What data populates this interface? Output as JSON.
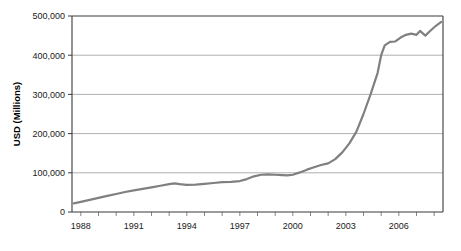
{
  "chart_data": {
    "type": "line",
    "title": "",
    "xlabel": "",
    "ylabel": "USD (Millions)",
    "xlim": [
      1987.5,
      2008.5
    ],
    "ylim": [
      0,
      500000
    ],
    "grid": true,
    "legend": "none",
    "y_ticks": [
      0,
      100000,
      200000,
      300000,
      400000,
      500000
    ],
    "y_tick_labels": [
      "0",
      "100,000",
      "200,000",
      "300,000",
      "400,000",
      "500,000"
    ],
    "x_ticks": [
      1988,
      1991,
      1994,
      1997,
      2000,
      2003,
      2006
    ],
    "x_tick_labels": [
      "1988",
      "1991",
      "1994",
      "1997",
      "2000",
      "2003",
      "2006"
    ],
    "series": [
      {
        "name": "USD (Millions)",
        "color": "#808080",
        "x": [
          1987.6,
          1988,
          1988.5,
          1989,
          1989.5,
          1990,
          1990.5,
          1991,
          1991.5,
          1992,
          1992.5,
          1993,
          1993.3,
          1993.6,
          1994,
          1994.5,
          1995,
          1995.5,
          1996,
          1996.5,
          1997,
          1997.4,
          1997.8,
          1998.2,
          1998.6,
          1999,
          1999.4,
          1999.7,
          2000,
          2000.4,
          2000.8,
          2001.2,
          2001.6,
          2002,
          2002.4,
          2002.8,
          2003.2,
          2003.6,
          2004,
          2004.4,
          2004.8,
          2005,
          2005.2,
          2005.5,
          2005.8,
          2006.1,
          2006.4,
          2006.7,
          2007,
          2007.2,
          2007.5,
          2007.8,
          2008.1,
          2008.4
        ],
        "y": [
          22000,
          26000,
          31000,
          36000,
          41000,
          46000,
          51000,
          55000,
          59000,
          63000,
          67000,
          71000,
          73000,
          71000,
          69000,
          70000,
          72000,
          74000,
          76000,
          77000,
          79000,
          84000,
          91000,
          95000,
          96000,
          95000,
          94000,
          93500,
          95000,
          101000,
          108000,
          114000,
          120000,
          124000,
          135000,
          152000,
          175000,
          205000,
          250000,
          300000,
          355000,
          400000,
          425000,
          434000,
          435000,
          445000,
          452000,
          455000,
          452000,
          462000,
          450000,
          463000,
          475000,
          485000
        ]
      }
    ]
  },
  "axes": {
    "y_axis_title": "USD (Millions)"
  }
}
